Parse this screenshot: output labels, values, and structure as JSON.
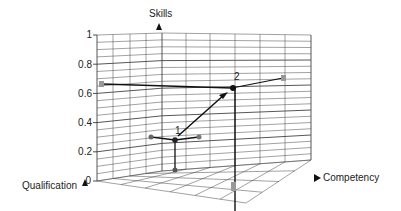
{
  "diagram": {
    "type": "3d-grid-plot",
    "axes": {
      "vertical": {
        "label": "Skills",
        "ticks": [
          "1",
          "0.8",
          "0.6",
          "0.4",
          "0.2",
          "0"
        ]
      },
      "depth": {
        "label": "Qualification"
      },
      "horizontal": {
        "label": "Competency"
      }
    },
    "points": [
      {
        "label": "1",
        "description": "initial position with projections"
      },
      {
        "label": "2",
        "description": "target position with projections"
      }
    ],
    "arrow": {
      "from": "1",
      "to": "2"
    },
    "colors": {
      "line": "#111111",
      "grid": "#333333",
      "projection_marker": "#888888",
      "point": "#222222"
    }
  }
}
